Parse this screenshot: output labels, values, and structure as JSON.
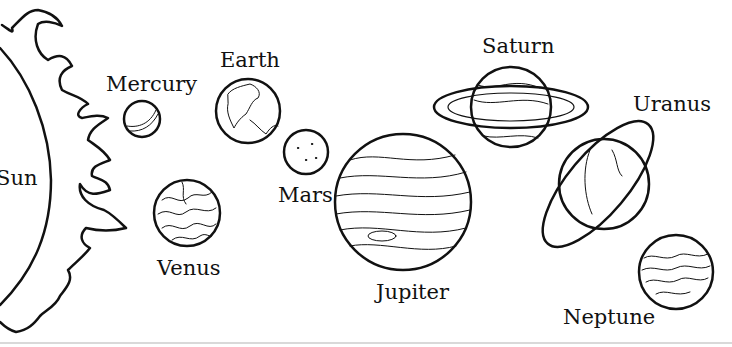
{
  "colors": {
    "line": "#111111",
    "background": "#ffffff"
  },
  "bodies": [
    {
      "name": "Sun",
      "label": "Sun"
    },
    {
      "name": "Mercury",
      "label": "Mercury"
    },
    {
      "name": "Venus",
      "label": "Venus"
    },
    {
      "name": "Earth",
      "label": "Earth"
    },
    {
      "name": "Mars",
      "label": "Mars"
    },
    {
      "name": "Jupiter",
      "label": "Jupiter"
    },
    {
      "name": "Saturn",
      "label": "Saturn"
    },
    {
      "name": "Uranus",
      "label": "Uranus"
    },
    {
      "name": "Neptune",
      "label": "Neptune"
    }
  ]
}
